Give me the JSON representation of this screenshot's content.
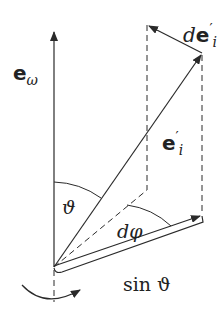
{
  "diagram": {
    "labels": {
      "e_omega": {
        "base": "e",
        "sub": "ω"
      },
      "e_i_prime": {
        "base": "e",
        "sup": "′",
        "sub": "i"
      },
      "de_i_prime": {
        "prefix": "d",
        "base": "e",
        "sup": "′",
        "sub": "i"
      },
      "theta": "ϑ",
      "dphi": "dφ",
      "sin_theta": "sin ϑ"
    },
    "colors": {
      "stroke": "#2a2a2a",
      "background": "#ffffff"
    }
  }
}
